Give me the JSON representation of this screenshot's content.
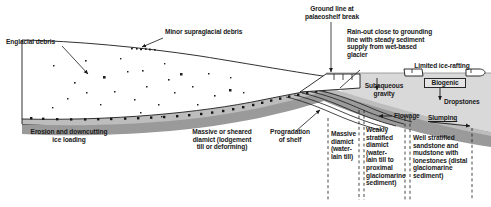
{
  "figure": {
    "type": "cross-section-diagram",
    "colors": {
      "ice_fill": "#ffffff",
      "outline": "#1a1a1a",
      "bedrock_fill": "#9a9a9a",
      "water_fill": "#d9d9d9",
      "diamict_fill": "#bdbdbd",
      "label_text": "#1a1a1a",
      "boxed_fill": "#e4e4e4"
    }
  },
  "labels": {
    "englacial_debris": "Englacial debris",
    "minor_supraglacial_debris": "Minor supraglacial debris",
    "ground_line": "Ground line at\npalaeoshelf break",
    "rain_out": "Rain-out close to grounding\nline with steady sediment\nsupply from wet-based\nglacier",
    "limited_ice_rafting": "Limited ice-rafting",
    "subaqueous_gravity": "Subaqueous\ngravity",
    "biogenic": "Biogenic",
    "dropstones": "Dropstones",
    "flowage": "Flowage",
    "slumping": "Slumping",
    "erosion_downcutting": "Erosion and downcutting\nice loading",
    "massive_sheared_diamict": "Massive or sheared\ndiamict (lodgement\ntill or deforming)",
    "progradation_of_shelf": "Progradation\nof shelf",
    "massive_diamict": "Massive\ndiamict\n(water-\nlain till)",
    "weakly_stratified": "Weakly\nstratified\ndiamict (water-\nlain till to\nproximal\nglaciomarine\nsediment)",
    "well_stratified": "Well stratified\nsandstone and\nmudstone with\nlonestones (distal\nglaciomarine\nsediment)"
  },
  "facies_zones": [
    {
      "name": "erosion-zone",
      "label": "Erosion and downcutting ice loading"
    },
    {
      "name": "lodgement-till-zone",
      "label": "Massive or sheared diamict (lodgement till or deforming)"
    },
    {
      "name": "progradation-zone",
      "label": "Progradation of shelf"
    },
    {
      "name": "massive-diamict-zone",
      "label": "Massive diamict (water-lain till)"
    },
    {
      "name": "weakly-stratified-zone",
      "label": "Weakly stratified diamict (water-lain till to proximal glaciomarine sediment)"
    },
    {
      "name": "well-stratified-zone",
      "label": "Well stratified sandstone and mudstone with lonestones (distal glaciomarine sediment)"
    }
  ],
  "processes": [
    "Rain-out close to grounding line",
    "Subaqueous gravity",
    "Flowage",
    "Slumping",
    "Biogenic",
    "Dropstones",
    "Limited ice-rafting"
  ]
}
